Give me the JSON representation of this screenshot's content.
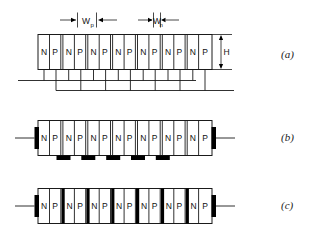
{
  "figure": {
    "width": 327,
    "height": 233,
    "background": "#ffffff",
    "line_color": "#1a1a1a",
    "fill_color": "#ffffff",
    "contact_color": "#000000"
  },
  "dimensions": {
    "width_p": {
      "symbol": "W",
      "subscript": "p",
      "text": "W"
    },
    "width_n": {
      "symbol": "W",
      "subscript": "n",
      "text": "W"
    },
    "height": {
      "symbol": "H",
      "text": "H"
    }
  },
  "panels": [
    {
      "id": "a",
      "label": "(a)",
      "description": "stripe array with interdigitated bottom bus wiring",
      "cells": [
        "N",
        "P",
        "N",
        "P",
        "N",
        "P",
        "N",
        "P",
        "N",
        "P",
        "N",
        "P",
        "N",
        "P"
      ],
      "pair_count": 7,
      "has_dimension_markers": true,
      "has_bus_wiring": true,
      "has_edge_contacts": false,
      "has_bottom_pads": false,
      "has_barriers": false
    },
    {
      "id": "b",
      "label": "(b)",
      "description": "stripe array with end terminals and five bottom contact pads",
      "cells": [
        "N",
        "P",
        "N",
        "P",
        "N",
        "P",
        "N",
        "P",
        "N",
        "P",
        "N",
        "P",
        "N",
        "P"
      ],
      "pair_count": 7,
      "has_dimension_markers": false,
      "has_bus_wiring": false,
      "has_edge_contacts": true,
      "has_bottom_pads": true,
      "bottom_pad_count": 5,
      "has_barriers": false
    },
    {
      "id": "c",
      "label": "(c)",
      "description": "stripe array with end terminals and internal barrier electrodes",
      "cells": [
        "N",
        "P",
        "N",
        "P",
        "N",
        "P",
        "N",
        "P",
        "N",
        "P",
        "N",
        "P",
        "N",
        "P"
      ],
      "pair_count": 7,
      "has_dimension_markers": false,
      "has_bus_wiring": false,
      "has_edge_contacts": true,
      "has_bottom_pads": false,
      "has_barriers": true,
      "barrier_count": 6
    }
  ]
}
